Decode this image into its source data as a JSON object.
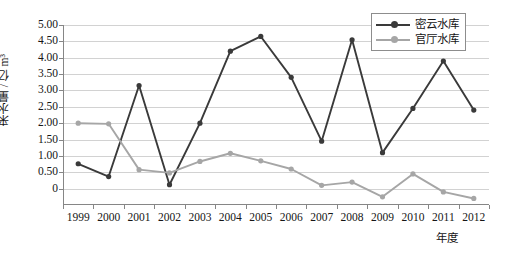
{
  "chart_data": {
    "type": "line",
    "title": "",
    "xlabel": "年度",
    "ylabel": "来水量 / 亿 m³",
    "categories": [
      "1999",
      "2000",
      "2001",
      "2002",
      "2003",
      "2004",
      "2005",
      "2006",
      "2007",
      "2008",
      "2009",
      "2010",
      "2011",
      "2012"
    ],
    "ylim": [
      -0.5,
      5.0
    ],
    "yticks": [
      "0",
      "0.50",
      "1.00",
      "1.50",
      "2.00",
      "2.50",
      "3.00",
      "3.50",
      "4.00",
      "4.50",
      "5.00"
    ],
    "ytick_values": [
      0,
      0.5,
      1.0,
      1.5,
      2.0,
      2.5,
      3.0,
      3.5,
      4.0,
      4.5,
      5.0
    ],
    "grid": true,
    "legend_position": "top-right",
    "series": [
      {
        "name": "密云水库",
        "color": "#3a3a3a",
        "values": [
          0.76,
          0.37,
          3.15,
          0.12,
          2.0,
          4.2,
          4.65,
          3.4,
          1.45,
          4.55,
          1.1,
          2.45,
          3.9,
          2.4
        ]
      },
      {
        "name": "官厅水库",
        "color": "#a6a6a6",
        "values": [
          2.0,
          1.98,
          0.58,
          0.48,
          0.83,
          1.08,
          0.85,
          0.6,
          0.1,
          0.2,
          -0.25,
          0.45,
          -0.1,
          -0.3
        ]
      }
    ]
  },
  "colors": {
    "series_dark": "#3a3a3a",
    "series_gray": "#a6a6a6",
    "grid": "#d2d2d2",
    "axis": "#868686",
    "text": "#161616",
    "background": "#ffffff"
  }
}
